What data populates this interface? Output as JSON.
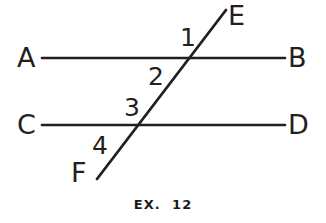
{
  "figure": {
    "caption": "EX.  12",
    "background_color": "#ffffff",
    "ink_color": "#231f20",
    "width": 326,
    "height": 223,
    "point_labels": {
      "a": "A",
      "b": "B",
      "c": "C",
      "d": "D",
      "e": "E",
      "f": "F"
    },
    "angle_labels": {
      "one": "1",
      "two": "2",
      "three": "3",
      "four": "4"
    },
    "lines": [
      {
        "name": "line-ab",
        "kind": "horizontal-parallel",
        "from_label": "A",
        "to_label": "B",
        "x1": 42,
        "y1": 58,
        "x2": 285,
        "y2": 58
      },
      {
        "name": "line-cd",
        "kind": "horizontal-parallel",
        "from_label": "C",
        "to_label": "D",
        "x1": 42,
        "y1": 125,
        "x2": 285,
        "y2": 125
      },
      {
        "name": "line-ef",
        "kind": "transversal",
        "from_label": "F",
        "to_label": "E",
        "x1": 97,
        "y1": 179,
        "x2": 226,
        "y2": 10
      }
    ],
    "intersections": [
      {
        "name": "intersection-ab-ef",
        "x": 195,
        "y": 58
      },
      {
        "name": "intersection-cd-ef",
        "x": 138,
        "y": 125
      }
    ],
    "stroke_width": 2.6
  }
}
